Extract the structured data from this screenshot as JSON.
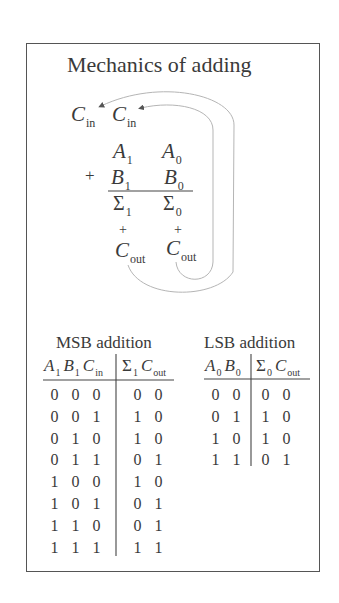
{
  "title": "Mechanics of adding",
  "diagram": {
    "carry_in_labels": [
      {
        "letter": "C",
        "sub": "in"
      },
      {
        "letter": "C",
        "sub": "in"
      }
    ],
    "row_a": [
      {
        "letter": "A",
        "sub": "1"
      },
      {
        "letter": "A",
        "sub": "0"
      }
    ],
    "operator": "+",
    "row_b": [
      {
        "letter": "B",
        "sub": "1"
      },
      {
        "letter": "B",
        "sub": "0"
      }
    ],
    "row_sum": [
      {
        "letter": "Σ",
        "sub": "1"
      },
      {
        "letter": "Σ",
        "sub": "0"
      }
    ],
    "carry_plus": [
      "+",
      "+"
    ],
    "carry_out_labels": [
      {
        "letter": "C",
        "sub": "out"
      },
      {
        "letter": "C",
        "sub": "out"
      }
    ],
    "arrows": [
      {
        "from": "Cout (LSB column)",
        "to": "Cin (MSB column)"
      },
      {
        "from": "Cout (MSB column)",
        "to": "Cin (leftmost)"
      }
    ]
  },
  "msb_table": {
    "title": "MSB addition",
    "input_headers": [
      {
        "letter": "A",
        "sub": "1"
      },
      {
        "letter": "B",
        "sub": "1"
      },
      {
        "letter": "C",
        "sub": "in"
      }
    ],
    "output_headers": [
      {
        "letter": "Σ",
        "sub": "1"
      },
      {
        "letter": "C",
        "sub": "out"
      }
    ],
    "rows": [
      {
        "inputs": [
          "0",
          "0",
          "0"
        ],
        "outputs": [
          "0",
          "0"
        ]
      },
      {
        "inputs": [
          "0",
          "0",
          "1"
        ],
        "outputs": [
          "1",
          "0"
        ]
      },
      {
        "inputs": [
          "0",
          "1",
          "0"
        ],
        "outputs": [
          "1",
          "0"
        ]
      },
      {
        "inputs": [
          "0",
          "1",
          "1"
        ],
        "outputs": [
          "0",
          "1"
        ]
      },
      {
        "inputs": [
          "1",
          "0",
          "0"
        ],
        "outputs": [
          "1",
          "0"
        ]
      },
      {
        "inputs": [
          "1",
          "0",
          "1"
        ],
        "outputs": [
          "0",
          "1"
        ]
      },
      {
        "inputs": [
          "1",
          "1",
          "0"
        ],
        "outputs": [
          "0",
          "1"
        ]
      },
      {
        "inputs": [
          "1",
          "1",
          "1"
        ],
        "outputs": [
          "1",
          "1"
        ]
      }
    ]
  },
  "lsb_table": {
    "title": "LSB addition",
    "input_headers": [
      {
        "letter": "A",
        "sub": "0"
      },
      {
        "letter": "B",
        "sub": "0"
      }
    ],
    "output_headers": [
      {
        "letter": "Σ",
        "sub": "0"
      },
      {
        "letter": "C",
        "sub": "out"
      }
    ],
    "rows": [
      {
        "inputs": [
          "0",
          "0"
        ],
        "outputs": [
          "0",
          "0"
        ]
      },
      {
        "inputs": [
          "0",
          "1"
        ],
        "outputs": [
          "1",
          "0"
        ]
      },
      {
        "inputs": [
          "1",
          "0"
        ],
        "outputs": [
          "1",
          "0"
        ]
      },
      {
        "inputs": [
          "1",
          "1"
        ],
        "outputs": [
          "0",
          "1"
        ]
      }
    ]
  },
  "colors": {
    "text": "#3a3a3a",
    "frame": "#555555",
    "arrow": "#b5b5b5",
    "background": "#ffffff"
  }
}
